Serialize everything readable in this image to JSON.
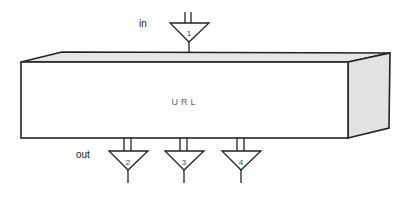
{
  "diagram": {
    "block_label": "URL",
    "input_label": "in",
    "output_label": "out",
    "ports": {
      "input": [
        {
          "number": "1"
        }
      ],
      "outputs": [
        {
          "number": "2"
        },
        {
          "number": "3"
        },
        {
          "number": "4"
        }
      ]
    },
    "colors": {
      "stroke": "#222222",
      "front_face": "#ffffff",
      "side_face": "#e2e2e2",
      "top_face": "#e6e6e6",
      "label": "#666666"
    }
  }
}
